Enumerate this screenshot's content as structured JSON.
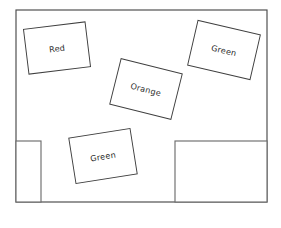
{
  "canvas": {
    "width": 281,
    "height": 228,
    "background_color": "#ffffff"
  },
  "diagram": {
    "kind": "floor-plan-sketch",
    "stroke_color": "#3f3f3f",
    "fill_color": "#ffffff"
  },
  "room": {
    "name": "room-outline",
    "x": 16,
    "y": 10,
    "width": 251,
    "height": 192,
    "stroke_color": "#4a4a4a"
  },
  "alcoves": [
    {
      "name": "bottom-left-alcove",
      "x": 16,
      "y": 141,
      "width": 25,
      "height": 61,
      "stroke_color": "#6d6d6d"
    },
    {
      "name": "bottom-right-alcove",
      "x": 175,
      "y": 141,
      "width": 92,
      "height": 61,
      "stroke_color": "#6d6d6d"
    }
  ],
  "boxes": [
    {
      "id": "box-red",
      "label": "Red",
      "cx": 57,
      "cy": 48,
      "width": 62,
      "height": 45,
      "rotation": -7,
      "stroke_color": "#3f3f3f",
      "fill_color": "#ffffff",
      "label_color": "#2b2b2b"
    },
    {
      "id": "box-green-top-right",
      "label": "Green",
      "cx": 224,
      "cy": 50,
      "width": 64,
      "height": 46,
      "rotation": 13,
      "stroke_color": "#3f3f3f",
      "fill_color": "#ffffff",
      "label_color": "#2b2b2b"
    },
    {
      "id": "box-orange",
      "label": "Orange",
      "cx": 146,
      "cy": 89,
      "width": 63,
      "height": 47,
      "rotation": 14,
      "stroke_color": "#3f3f3f",
      "fill_color": "#ffffff",
      "label_color": "#2b2b2b"
    },
    {
      "id": "box-green-bottom",
      "label": "Green",
      "cx": 103,
      "cy": 156,
      "width": 62,
      "height": 46,
      "rotation": -9,
      "stroke_color": "#3f3f3f",
      "fill_color": "#ffffff",
      "label_color": "#2b2b2b"
    }
  ]
}
